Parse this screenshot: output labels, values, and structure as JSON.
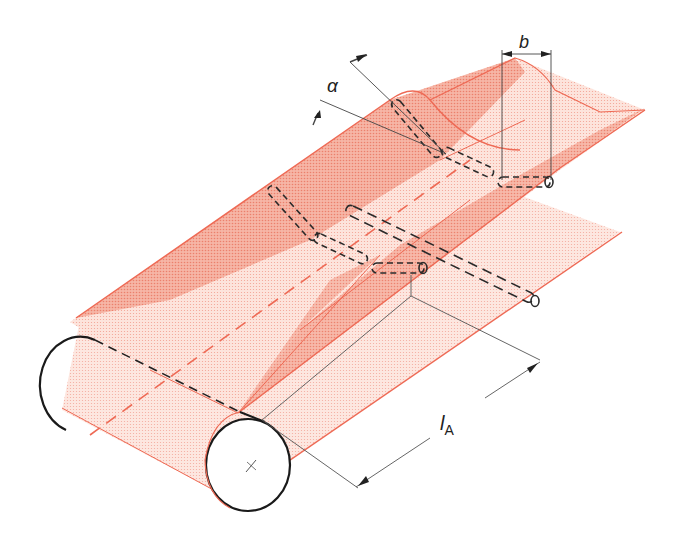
{
  "diagram": {
    "labels": {
      "alpha": "α",
      "b": "b",
      "l_main": "l",
      "l_sub": "A"
    },
    "colors": {
      "belt_light": "#fbd9cf",
      "belt_dark": "#f4a594",
      "belt_edge": "#ee6a55",
      "ink": "#222222",
      "dim_line": "#555555"
    }
  }
}
